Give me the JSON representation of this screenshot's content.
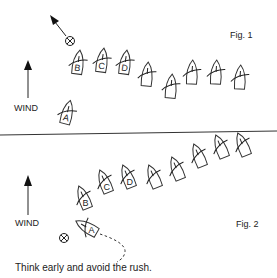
{
  "fig1": {
    "label": "Fig. 1",
    "wind_label": "WIND",
    "boats": [
      {
        "id": "A",
        "label": "A"
      },
      {
        "id": "B",
        "label": "B"
      },
      {
        "id": "C",
        "label": "C"
      },
      {
        "id": "D",
        "label": "D"
      },
      {
        "id": "5",
        "label": ""
      },
      {
        "id": "6",
        "label": ""
      },
      {
        "id": "7",
        "label": ""
      },
      {
        "id": "8",
        "label": ""
      },
      {
        "id": "9",
        "label": ""
      }
    ],
    "icons": [
      "mark-buoy-icon",
      "direction-arrow-icon",
      "wind-arrow-icon"
    ]
  },
  "fig2": {
    "label": "Fig. 2",
    "wind_label": "WIND",
    "boats": [
      {
        "id": "A",
        "label": "A"
      },
      {
        "id": "B",
        "label": "B"
      },
      {
        "id": "C",
        "label": "C"
      },
      {
        "id": "D",
        "label": "D"
      },
      {
        "id": "5",
        "label": ""
      },
      {
        "id": "6",
        "label": ""
      },
      {
        "id": "7",
        "label": ""
      },
      {
        "id": "8",
        "label": ""
      },
      {
        "id": "9",
        "label": ""
      }
    ],
    "icons": [
      "mark-buoy-icon",
      "dashed-track-icon",
      "wind-arrow-icon"
    ]
  },
  "caption": "Think early and avoid the rush."
}
